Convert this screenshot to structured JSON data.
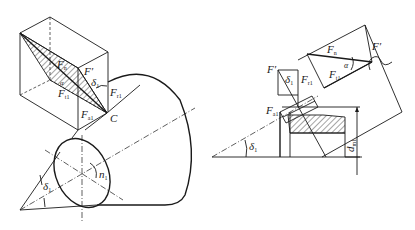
{
  "figure": {
    "left_view": {
      "labels": {
        "F_prime": "F′",
        "delta1": "δ",
        "delta1_sub": "1",
        "F_r1": "F",
        "F_r1_sub": "r1",
        "F_a1": "F",
        "F_a1_sub": "a1",
        "F_t1": "F",
        "F_t1_sub": "t1",
        "F_n": "F",
        "F_n_sub": "n",
        "alpha": "α",
        "C": "C",
        "n1": "n",
        "n1_sub": "1",
        "delta1_bottom": "δ",
        "delta1_bottom_sub": "1"
      }
    },
    "right_view": {
      "labels": {
        "F_prime_top": "F′",
        "F_n": "F",
        "F_n_sub": "n",
        "alpha": "α",
        "F_t1": "F",
        "F_t1_sub": "t1",
        "F_prime_left": "F′",
        "delta1_upper": "δ",
        "delta1_upper_sub": "1",
        "F_r1": "F",
        "F_r1_sub": "r1",
        "F_a1": "F",
        "F_a1_sub": "a1",
        "delta1_lower": "δ",
        "delta1_lower_sub": "1",
        "d_m1": "d",
        "d_m1_sub": "m1"
      }
    }
  }
}
